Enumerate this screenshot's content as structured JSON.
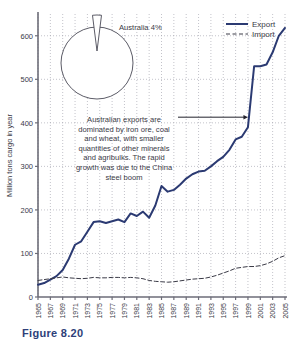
{
  "figure": {
    "caption": "Figure 8.20",
    "alt_title": "Australian seaborne trade"
  },
  "chart_data": {
    "type": "line",
    "title": "",
    "xlabel": "",
    "ylabel": "Million tons cargo in year",
    "xlim": [
      1965,
      2005
    ],
    "ylim": [
      0,
      650
    ],
    "yticks": [
      0,
      100,
      200,
      300,
      400,
      500,
      600
    ],
    "ytick_labels": [
      "0",
      "100",
      "200",
      "300",
      "400",
      "500",
      "600"
    ],
    "xticks": [
      1965,
      1967,
      1969,
      1971,
      1973,
      1975,
      1977,
      1979,
      1981,
      1983,
      1985,
      1987,
      1989,
      1991,
      1993,
      1995,
      1997,
      1999,
      2001,
      2003,
      2005
    ],
    "xtick_labels": [
      "1965",
      "1967",
      "1969",
      "1971",
      "1973",
      "1975",
      "1977",
      "1979",
      "1981",
      "1983",
      "1985",
      "1987",
      "1989",
      "1991",
      "1993",
      "1995",
      "1997",
      "1999",
      "2001",
      "2003",
      "2005"
    ],
    "grid": true,
    "grid_style": "dotted",
    "legend_position": "top-right",
    "x": [
      1965,
      1966,
      1967,
      1968,
      1969,
      1970,
      1971,
      1972,
      1973,
      1974,
      1975,
      1976,
      1977,
      1978,
      1979,
      1980,
      1981,
      1982,
      1983,
      1984,
      1985,
      1986,
      1987,
      1988,
      1989,
      1990,
      1991,
      1992,
      1993,
      1994,
      1995,
      1996,
      1997,
      1998,
      1999,
      2000,
      2001,
      2002,
      2003,
      2004,
      2005
    ],
    "series": [
      {
        "name": "Export",
        "style": "solid",
        "color": "#2b3a72",
        "values": [
          28,
          32,
          40,
          48,
          62,
          88,
          120,
          128,
          150,
          172,
          174,
          170,
          174,
          178,
          172,
          192,
          186,
          196,
          182,
          210,
          255,
          242,
          246,
          258,
          272,
          282,
          288,
          290,
          300,
          312,
          322,
          338,
          362,
          368,
          390,
          530,
          530,
          534,
          562,
          600,
          618
        ]
      },
      {
        "name": "Import",
        "style": "dashed",
        "color": "#3a3a46",
        "values": [
          38,
          40,
          42,
          44,
          46,
          44,
          43,
          42,
          43,
          45,
          44,
          44,
          45,
          45,
          44,
          45,
          44,
          42,
          38,
          36,
          35,
          34,
          35,
          37,
          39,
          41,
          42,
          43,
          46,
          50,
          55,
          60,
          66,
          68,
          70,
          70,
          72,
          76,
          82,
          90,
          95
        ]
      }
    ],
    "annotations": [
      {
        "name": "export-annotation",
        "text": "Australian exports are dominated by iron ore, coal and wheat, with smaller quantities of other minerals and agribulks. The rapid growth was due to the China steel boom",
        "lines": [
          "Australian exports are",
          "dominated by iron ore, coal",
          "and wheat, with smaller",
          "quantities of other minerals",
          "and agribulks. The rapid",
          "growth was due to the China",
          "steel boom"
        ],
        "arrow_to_year": 1999,
        "arrow_to_value": 413
      }
    ],
    "inset_pie": {
      "type": "pie",
      "label": "Australia 4%",
      "slices": [
        {
          "name": "Australia",
          "value": 4,
          "exploded": true
        },
        {
          "name": "Rest of world",
          "value": 96,
          "exploded": false
        }
      ]
    }
  },
  "legend": {
    "items": [
      {
        "label": "Export",
        "style": "solid"
      },
      {
        "label": "Import",
        "style": "dashed"
      }
    ]
  },
  "colors": {
    "line_export": "#2b3a72",
    "line_import": "#3a3a46",
    "axis": "#6d6d78",
    "grid": "#9a9aa6",
    "text": "#3a3a46",
    "caption": "#2e3f79"
  }
}
